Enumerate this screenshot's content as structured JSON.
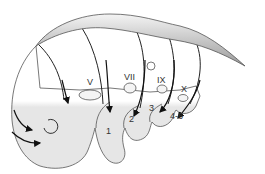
{
  "diagram": {
    "nerve_labels": [
      {
        "id": "V",
        "text": "V"
      },
      {
        "id": "VII",
        "text": "VII"
      },
      {
        "id": "IX",
        "text": "IX"
      },
      {
        "id": "X",
        "text": "X"
      }
    ],
    "arch_labels": [
      {
        "id": "1",
        "text": "1"
      },
      {
        "id": "2",
        "text": "2"
      },
      {
        "id": "3",
        "text": "3"
      },
      {
        "id": "4-6",
        "text": "4-6"
      }
    ],
    "colors": {
      "body_fill": "#e8e8e8",
      "outline": "#555555",
      "arrow": "#111111",
      "neural_tube_light": "#f0f0f0",
      "neural_tube_dark": "#9a9a9a"
    }
  }
}
